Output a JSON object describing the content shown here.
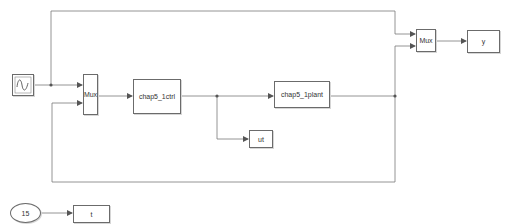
{
  "diagram": {
    "type": "simulink-model",
    "colors": {
      "line": "#7a7a7a",
      "block_border": "#6b6b6b",
      "text": "#333333",
      "background": "#ffffff"
    },
    "blocks": {
      "sine": {
        "name": "Sine Wave",
        "icon": "sine-wave-icon"
      },
      "mux1": {
        "label": "Mux"
      },
      "ctrl": {
        "label": "chap5_1ctrl"
      },
      "plant": {
        "label": "chap5_1plant"
      },
      "ut": {
        "label": "ut"
      },
      "mux2": {
        "label": "Mux"
      },
      "y": {
        "label": "y"
      },
      "const": {
        "label": "15"
      },
      "t": {
        "label": "t"
      }
    },
    "connections": [
      {
        "from": "sine",
        "to": "mux1.in1"
      },
      {
        "from": "sine",
        "to": "mux2.in1"
      },
      {
        "from": "mux1",
        "to": "ctrl"
      },
      {
        "from": "ctrl",
        "to": "plant"
      },
      {
        "from": "ctrl",
        "to": "ut"
      },
      {
        "from": "plant",
        "to": "mux2.in2"
      },
      {
        "from": "plant",
        "to": "mux1.in2"
      },
      {
        "from": "mux2",
        "to": "y"
      },
      {
        "from": "const",
        "to": "t"
      }
    ]
  }
}
